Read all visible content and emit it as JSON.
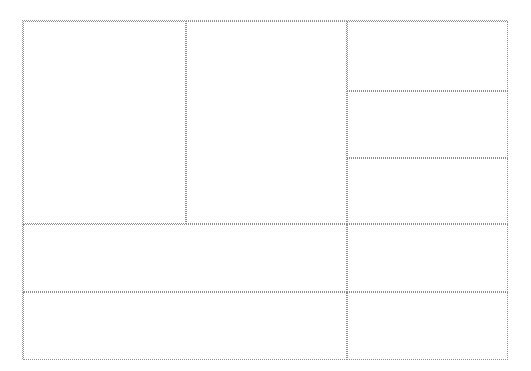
{
  "diagram": {
    "type": "grid-layout-wireframe",
    "frame": {
      "x": 22,
      "y": 20,
      "width": 485,
      "height": 339
    },
    "cells": [
      {
        "name": "cell-top-left-tall",
        "x": 0,
        "y": 0,
        "w": 163,
        "h": 203
      },
      {
        "name": "cell-top-middle-tall",
        "x": 163,
        "y": 0,
        "w": 161,
        "h": 203
      },
      {
        "name": "cell-right-1",
        "x": 324,
        "y": 0,
        "w": 161,
        "h": 70
      },
      {
        "name": "cell-right-2",
        "x": 324,
        "y": 70,
        "w": 161,
        "h": 67
      },
      {
        "name": "cell-right-3",
        "x": 324,
        "y": 137,
        "w": 161,
        "h": 66
      },
      {
        "name": "cell-wide-row-1",
        "x": 0,
        "y": 203,
        "w": 324,
        "h": 68
      },
      {
        "name": "cell-right-4",
        "x": 324,
        "y": 203,
        "w": 161,
        "h": 68
      },
      {
        "name": "cell-wide-row-2",
        "x": 0,
        "y": 271,
        "w": 324,
        "h": 68
      },
      {
        "name": "cell-right-5",
        "x": 324,
        "y": 271,
        "w": 161,
        "h": 68
      }
    ],
    "border_color": "#8f8f8f"
  }
}
